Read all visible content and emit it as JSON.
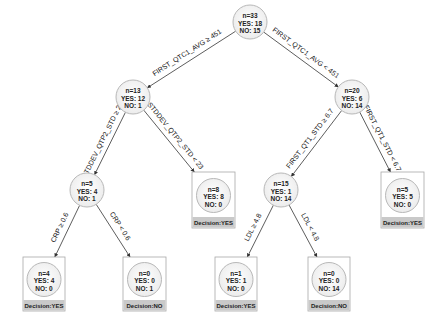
{
  "diagram": {
    "type": "decision-tree",
    "colors": {
      "circle_fill": "#f2f2f2",
      "circle_stroke": "#b8b8b8",
      "box_stroke": "#a8a8a8",
      "decision_fill": "#c9c9c9",
      "edge": "#333333"
    },
    "nodes": [
      {
        "id": "root",
        "n": "n=33",
        "yes": "YES: 18",
        "no": "NO: 15",
        "leaf": false
      },
      {
        "id": "n13",
        "n": "n=13",
        "yes": "YES: 12",
        "no": "NO: 1",
        "leaf": false
      },
      {
        "id": "n20",
        "n": "n=20",
        "yes": "YES: 6",
        "no": "NO: 14",
        "leaf": false
      },
      {
        "id": "n5a",
        "n": "n=5",
        "yes": "YES: 4",
        "no": "NO: 1",
        "leaf": false
      },
      {
        "id": "leaf8",
        "n": "n=8",
        "yes": "YES: 8",
        "no": "NO: 0",
        "leaf": true,
        "decision": "Decision:YES"
      },
      {
        "id": "n15",
        "n": "n=15",
        "yes": "YES: 1",
        "no": "NO: 14",
        "leaf": false
      },
      {
        "id": "leaf5",
        "n": "n=5",
        "yes": "YES: 5",
        "no": "NO: 0",
        "leaf": true,
        "decision": "Decision:YES"
      },
      {
        "id": "leaf4",
        "n": "n=4",
        "yes": "YES: 4",
        "no": "NO: 0",
        "leaf": true,
        "decision": "Decision:YES"
      },
      {
        "id": "leaf0a",
        "n": "n=0",
        "yes": "YES: 0",
        "no": "NO: 1",
        "leaf": true,
        "decision": "Decision:NO"
      },
      {
        "id": "leaf1",
        "n": "n=1",
        "yes": "YES: 1",
        "no": "NO: 0",
        "leaf": true,
        "decision": "Decision:YES"
      },
      {
        "id": "leaf0b",
        "n": "n=0",
        "yes": "YES: 0",
        "no": "NO: 14",
        "leaf": true,
        "decision": "Decision:NO"
      }
    ],
    "edges": [
      {
        "from": "root",
        "to": "n13",
        "label": "FIRST_QTC1_AVG ≥ 451"
      },
      {
        "from": "root",
        "to": "n20",
        "label": "FIRST_QTC1_AVG < 451"
      },
      {
        "from": "n13",
        "to": "n5a",
        "label": "STDDEV_QTP2_STD ≥ 23"
      },
      {
        "from": "n13",
        "to": "leaf8",
        "label": "STDDEV_QTP2_STD < 23"
      },
      {
        "from": "n20",
        "to": "n15",
        "label": "FIRST_QT1_STD ≥ 6.7"
      },
      {
        "from": "n20",
        "to": "leaf5",
        "label": "FIRST_QT1_STD < 6.7"
      },
      {
        "from": "n5a",
        "to": "leaf4",
        "label": "CRP ≥ 0.6"
      },
      {
        "from": "n5a",
        "to": "leaf0a",
        "label": "CRP < 0.6"
      },
      {
        "from": "n15",
        "to": "leaf1",
        "label": "LDL ≥ 4.8"
      },
      {
        "from": "n15",
        "to": "leaf0b",
        "label": "LDL < 4.8"
      }
    ]
  }
}
